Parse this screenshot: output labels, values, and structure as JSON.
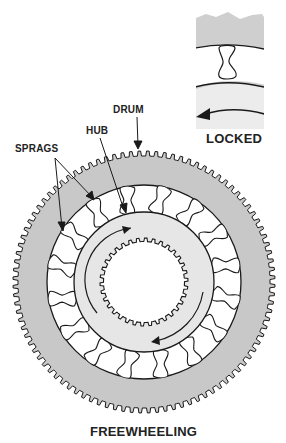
{
  "figure": {
    "type": "sprag-clutch-diagram",
    "labels": {
      "drum": "DRUM",
      "hub": "HUB",
      "sprags": "SPRAGS",
      "locked": "LOCKED",
      "freewheeling": "FREEWHEELING"
    },
    "colors": {
      "drum_fill": "#c8c8c8",
      "hub_fill": "#e6e6e6",
      "sprag_ring_fill": "#ffffff",
      "line": "#1a1a1a",
      "inset_fill": "#cfcfcf",
      "inset_lower_fill": "#ececec"
    },
    "geometry": {
      "center": [
        144,
        282
      ],
      "drum_outer_radius": 131,
      "drum_tooth_depth": 5,
      "drum_tooth_count": 96,
      "sprag_ring_radius": 97,
      "hub_radius": 70,
      "spline_radius": 44,
      "spline_tooth_depth": 3.5,
      "spline_tooth_count": 34,
      "sprag_count": 16
    },
    "insets": [
      {
        "name": "locked-inset",
        "caption": "LOCKED"
      }
    ],
    "main_caption": "FREEWHEELING"
  }
}
